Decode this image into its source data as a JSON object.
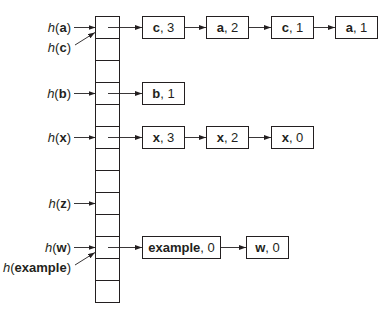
{
  "diagram": {
    "hash_fn": "h",
    "paren_open": "(",
    "paren_close": ")",
    "separator": ", ",
    "bucket_count": 13,
    "line_color": "#231f20",
    "hash_labels": [
      {
        "key": "a",
        "bucket": 0
      },
      {
        "key": "c",
        "bucket": 0
      },
      {
        "key": "b",
        "bucket": 3
      },
      {
        "key": "x",
        "bucket": 5
      },
      {
        "key": "z",
        "bucket": 8
      },
      {
        "key": "w",
        "bucket": 10
      },
      {
        "key": "example",
        "bucket": 10
      }
    ],
    "chains": [
      {
        "bucket": 0,
        "nodes": [
          {
            "key": "c",
            "value": "3"
          },
          {
            "key": "a",
            "value": "2"
          },
          {
            "key": "c",
            "value": "1"
          },
          {
            "key": "a",
            "value": "1"
          }
        ]
      },
      {
        "bucket": 3,
        "nodes": [
          {
            "key": "b",
            "value": "1"
          }
        ]
      },
      {
        "bucket": 5,
        "nodes": [
          {
            "key": "x",
            "value": "3"
          },
          {
            "key": "x",
            "value": "2"
          },
          {
            "key": "x",
            "value": "0"
          }
        ]
      },
      {
        "bucket": 10,
        "nodes": [
          {
            "key": "example",
            "value": "0"
          },
          {
            "key": "w",
            "value": "0"
          }
        ]
      }
    ]
  }
}
